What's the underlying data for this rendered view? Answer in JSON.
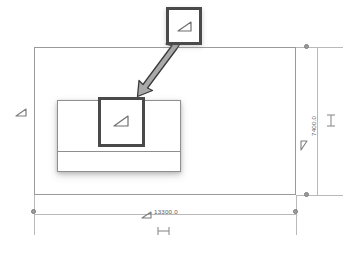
{
  "diagram": {
    "type": "cad-floor-plan-dimensioned",
    "title": "",
    "background_color": "#ffffff",
    "line_color": "#9a9a9a",
    "highlight_color": "#4a4a4a",
    "dimension_color": "#b9b9b9",
    "arrow_fill": "#a8a8a8",
    "arrow_stroke": "#3d3d3d"
  },
  "shapes": {
    "outer_boundary": {
      "name": "site-boundary-rectangle",
      "label": ""
    },
    "building_block": {
      "name": "building-footprint",
      "label": ""
    },
    "selected_square": {
      "name": "selected-element-square",
      "label": ""
    },
    "callout_box": {
      "name": "zoom-callout-box",
      "label": ""
    }
  },
  "markers": {
    "triangle_glyph_name": "triangle-marker-icon",
    "extent_glyph_name": "dimension-extent-icon",
    "dot_name": "dimension-endpoint-dot"
  },
  "dimensions": {
    "horizontal": {
      "name": "horizontal-dimension",
      "value": "13300.0",
      "unit": "",
      "orientation": "horizontal"
    },
    "vertical": {
      "name": "vertical-dimension",
      "value": "7400.0",
      "unit": "",
      "orientation": "vertical"
    }
  },
  "annotations": {
    "connector_arrow": {
      "name": "callout-connector-arrow",
      "label": "",
      "style": "double-headed"
    }
  }
}
